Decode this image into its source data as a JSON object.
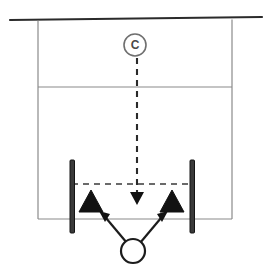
{
  "diagram": {
    "background_color": "#ffffff",
    "width": 267,
    "height": 274,
    "colors": {
      "field_line": "#8a8a8a",
      "boundary_line": "#2b2b2b",
      "post": "#3a3a3a",
      "cone": "#121212",
      "ball_outline": "#1c1c1c",
      "coach_outline": "#6f6f6f",
      "dashed_run": "#2a2a2a"
    },
    "markers": {
      "coach": {
        "label": "C",
        "name": "coach",
        "cx": 135,
        "cy": 45,
        "r": 11
      },
      "ball": {
        "label": "",
        "name": "ball",
        "cx": 133,
        "cy": 251,
        "r": 12
      },
      "cones": [
        {
          "name": "cone-left",
          "cx": 91,
          "cy": 201,
          "half_width": 12,
          "height": 21
        },
        {
          "name": "cone-right",
          "cx": 172,
          "cy": 201,
          "half_width": 12,
          "height": 21
        }
      ],
      "posts": [
        {
          "name": "post-left",
          "x": 70,
          "y": 160,
          "width": 4,
          "height": 73
        },
        {
          "name": "post-right",
          "x": 190,
          "y": 160,
          "width": 4,
          "height": 73
        }
      ]
    },
    "field_lines": {
      "top_boundary": {
        "x1": 10,
        "y1": 20,
        "x2": 262,
        "y2": 17
      },
      "left_sideline": {
        "x1": 38,
        "y1": 21,
        "x2": 38,
        "y2": 219
      },
      "right_sideline": {
        "x1": 232,
        "y1": 20,
        "x2": 232,
        "y2": 219
      },
      "mid_line": {
        "x1": 38,
        "y1": 87,
        "x2": 232,
        "y2": 87
      },
      "bottom_line": {
        "x1": 38,
        "y1": 219,
        "x2": 232,
        "y2": 219
      }
    },
    "movement": {
      "coach_run": {
        "name": "coach-run-path",
        "style": "dashed",
        "from": {
          "x": 137,
          "y": 58
        },
        "to": {
          "x": 137,
          "y": 193
        },
        "arrow": "down"
      },
      "lateral_dashed": {
        "name": "lateral-dashed-line",
        "style": "dashed",
        "from": {
          "x": 72,
          "y": 184
        },
        "to": {
          "x": 194,
          "y": 184
        }
      },
      "pass_left": {
        "name": "pass-arrow-left",
        "style": "solid",
        "from": {
          "x": 125,
          "y": 242
        },
        "to": {
          "x": 101,
          "y": 213
        },
        "arrow": "up-left"
      },
      "pass_right": {
        "name": "pass-arrow-right",
        "style": "solid",
        "from": {
          "x": 142,
          "y": 242
        },
        "to": {
          "x": 166,
          "y": 213
        },
        "arrow": "up-right"
      }
    }
  }
}
